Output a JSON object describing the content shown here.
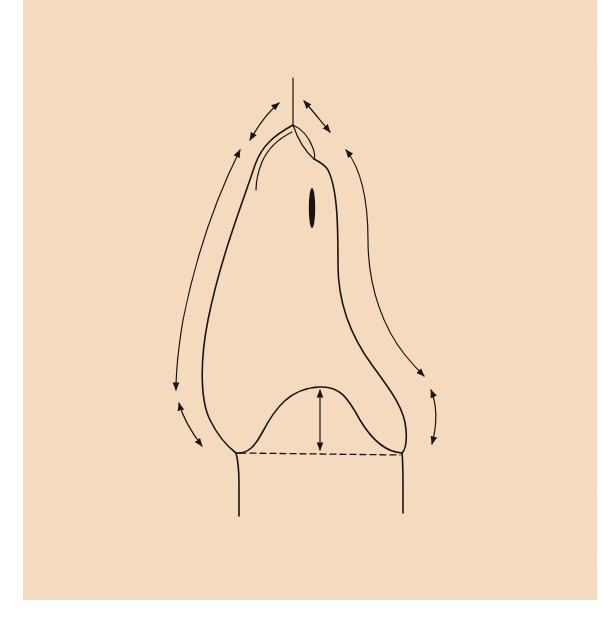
{
  "figure": {
    "type": "line-drawing diagram",
    "colors": {
      "background": "#f4d9bd",
      "page": "#ffffff",
      "ink": "#1a1410"
    },
    "elements": {
      "axis_line": "vertical-axis-line",
      "outline": "main-outline",
      "inner_contour": "inner-contour-line",
      "apex_lobe": "apex-lobe",
      "base_arch": "base-arch",
      "baseline": "dashed-baseline",
      "height_arrow": "vertical-height-arrow",
      "mark": "dark-oblong-mark",
      "arrows_count": 7
    }
  }
}
